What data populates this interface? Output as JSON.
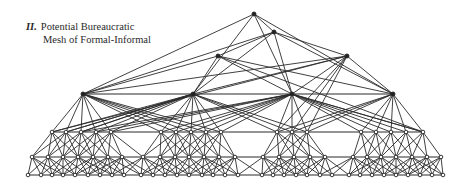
{
  "caption": {
    "number": "II.",
    "line1": "Potential Bureaucratic",
    "line2": "Mesh of Formal-Informal"
  },
  "colors": {
    "ink": "#2b2b2b",
    "background": "#ffffff"
  },
  "diagram": {
    "levels": [
      {
        "y": 14,
        "xs": [
          254
        ]
      },
      {
        "y": 32,
        "xs": [
          274
        ]
      },
      {
        "y": 56,
        "xs": [
          218,
          347
        ]
      },
      {
        "y": 94,
        "xs": [
          83,
          193,
          292,
          393
        ]
      },
      {
        "y": 132,
        "xs": [
          52,
          66,
          81,
          96,
          111,
          161,
          176,
          191,
          206,
          221,
          277,
          292,
          307,
          361,
          376,
          391,
          406,
          423
        ]
      },
      {
        "y": 157,
        "xs": [
          32,
          48,
          63,
          78,
          93,
          108,
          122,
          143,
          160,
          175,
          189,
          204,
          219,
          235,
          263,
          279,
          294,
          310,
          325,
          353,
          367,
          381,
          396,
          412,
          427,
          441
        ]
      },
      {
        "y": 175,
        "xs": [
          28,
          41,
          52,
          63,
          75,
          88,
          100,
          112,
          124,
          141,
          153,
          165,
          177,
          189,
          202,
          213,
          225,
          238,
          262,
          273,
          284,
          296,
          307,
          320,
          332,
          349,
          360,
          372,
          384,
          396,
          408,
          420,
          432,
          443
        ]
      }
    ]
  }
}
